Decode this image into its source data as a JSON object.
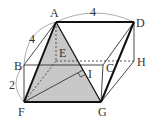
{
  "diagram": {
    "labels": {
      "A": "A",
      "B": "B",
      "C": "C",
      "D": "D",
      "E": "E",
      "F": "F",
      "G": "G",
      "H": "H",
      "I": "I"
    },
    "dimensions": {
      "AD": "4",
      "AB": "4",
      "BF": "2"
    },
    "colors": {
      "shade": "#c8c8c8",
      "line": "#222222",
      "thin": "#555555"
    }
  }
}
